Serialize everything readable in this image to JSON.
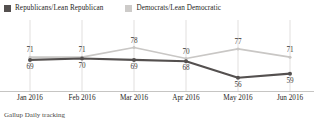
{
  "legend": {
    "entries": [
      {
        "label": "Republicans/Lean Republican",
        "color": "#54504f",
        "marker": "legend-swatch-republican"
      },
      {
        "label": "Democrats/Lean Democratic",
        "color": "#cdcbc9",
        "marker": "legend-swatch-democrat"
      }
    ]
  },
  "footnote": "Gallup Daily tracking",
  "chart_data": {
    "type": "line",
    "title": "",
    "subtitle": "",
    "xlabel": "",
    "ylabel": "",
    "categories": [
      "Jan 2016",
      "Feb 2016",
      "Mar 2016",
      "Apr 2016",
      "May 2016",
      "Jun 2016"
    ],
    "series": [
      {
        "name": "Republicans/Lean Republican",
        "color": "#54504f",
        "values": [
          69,
          70,
          69,
          68,
          56,
          59
        ],
        "label_position": "below"
      },
      {
        "name": "Democrats/Lean Democratic",
        "color": "#c9c7c5",
        "values": [
          71,
          71,
          78,
          70,
          77,
          71
        ],
        "label_position": "above"
      }
    ],
    "ylim": [
      50,
      82
    ],
    "grid": "vertical",
    "legend_position": "top-left",
    "annotations": [
      "Gallup Daily tracking"
    ]
  }
}
